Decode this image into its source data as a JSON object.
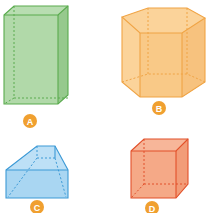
{
  "figure": {
    "badge_color": "#f0a030",
    "shapes": [
      {
        "label": "A",
        "name": "rectangular prism (cuboid)",
        "fill": "#a8d5a0",
        "stroke": "#5aab4e"
      },
      {
        "label": "B",
        "name": "hexagonal prism",
        "fill": "#fbd39a",
        "stroke": "#f0a445"
      },
      {
        "label": "C",
        "name": "frustum-like solid (trapezoidal prism)",
        "fill": "#a9d6f2",
        "stroke": "#3d9ad6"
      },
      {
        "label": "D",
        "name": "cube",
        "fill": "#f5a987",
        "stroke": "#e2502a"
      }
    ]
  }
}
